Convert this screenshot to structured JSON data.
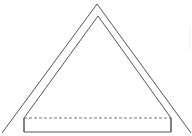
{
  "diagram": {
    "type": "line-drawing",
    "stroke_color": "#555555",
    "dashed_color": "#777777",
    "background": "#ffffff",
    "outer_triangle": {
      "apex": [
        97,
        4
      ],
      "left": [
        2,
        133
      ],
      "right": [
        191,
        133
      ]
    },
    "inner_triangle": {
      "apex": [
        98,
        16
      ],
      "left": [
        24,
        118
      ],
      "right": [
        171,
        118
      ]
    },
    "base_block": {
      "x": 24,
      "y": 118,
      "width": 147,
      "height": 14,
      "top_edge": "dashed"
    }
  }
}
